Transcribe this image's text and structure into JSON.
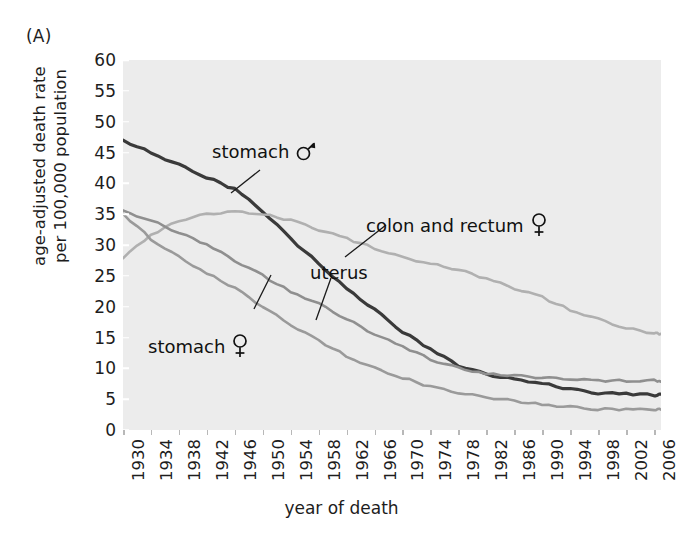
{
  "panel": {
    "label": "(A)"
  },
  "axes": {
    "ylabel": "age-adjusted death rate\nper 100,000 population",
    "ylabel_line1": "age-adjusted death rate",
    "ylabel_line2": "per 100,000 population",
    "xlabel": "year of death"
  },
  "annotations": [
    {
      "name": "stomach-male",
      "text": "stomach",
      "symbol": "male-symbol"
    },
    {
      "name": "colon-and-rectum-female",
      "text": "colon and rectum",
      "symbol": "female-symbol"
    },
    {
      "name": "uterus",
      "text": "uterus",
      "symbol": "none"
    },
    {
      "name": "stomach-female",
      "text": "stomach",
      "symbol": "female-symbol"
    }
  ],
  "colors": {
    "plot_background": "#ececec",
    "stomach_male": "#3a3a3a",
    "colon_rectum_female": "#b0b0b0",
    "uterus": "#8f8f8f",
    "stomach_female": "#9a9a9a",
    "text": "#1d1d1d"
  },
  "chart_data": {
    "type": "line",
    "title": "",
    "xlabel": "year of death",
    "ylabel": "age-adjusted death rate per 100,000 population",
    "xlim": [
      1930,
      2007
    ],
    "ylim": [
      0,
      60
    ],
    "ytick_labels": [
      0,
      5,
      10,
      15,
      20,
      25,
      30,
      35,
      40,
      45,
      50,
      55,
      60
    ],
    "xtick_labels": [
      1930,
      1934,
      1938,
      1942,
      1946,
      1950,
      1954,
      1958,
      1962,
      1966,
      1970,
      1974,
      1978,
      1982,
      1986,
      1990,
      1994,
      1998,
      2002,
      2006
    ],
    "grid": false,
    "legend_position": "inline-annotations",
    "x": [
      1930,
      1934,
      1938,
      1942,
      1946,
      1950,
      1954,
      1958,
      1962,
      1966,
      1970,
      1974,
      1978,
      1982,
      1986,
      1990,
      1994,
      1998,
      2002,
      2006,
      2007
    ],
    "series": [
      {
        "name": "stomach",
        "label": "stomach ♂",
        "sex": "male",
        "color": "#3a3a3a",
        "values": [
          47.0,
          45.0,
          43.0,
          41.0,
          39.0,
          35.5,
          31.0,
          27.0,
          23.0,
          19.5,
          16.0,
          13.0,
          10.5,
          9.0,
          8.3,
          7.6,
          6.6,
          6.0,
          5.8,
          5.7,
          5.7
        ]
      },
      {
        "name": "colon and rectum",
        "label": "colon and rectum ♀",
        "sex": "female",
        "color": "#b0b0b0",
        "values": [
          28.0,
          31.5,
          34.0,
          35.0,
          35.5,
          35.0,
          34.0,
          32.5,
          31.0,
          29.5,
          28.0,
          27.0,
          26.0,
          24.5,
          23.0,
          21.5,
          19.5,
          18.0,
          16.5,
          15.7,
          15.5
        ]
      },
      {
        "name": "uterus",
        "label": "uterus",
        "sex": "female",
        "color": "#8f8f8f",
        "values": [
          35.5,
          34.0,
          32.0,
          30.0,
          27.5,
          25.0,
          22.5,
          20.5,
          18.0,
          15.5,
          13.5,
          11.5,
          10.0,
          9.2,
          8.8,
          8.5,
          8.2,
          8.0,
          8.0,
          8.0,
          8.0
        ]
      },
      {
        "name": "stomach",
        "label": "stomach ♀",
        "sex": "female",
        "color": "#9a9a9a",
        "values": [
          35.0,
          31.0,
          28.0,
          25.5,
          23.0,
          20.0,
          17.0,
          14.5,
          12.0,
          10.0,
          8.5,
          7.0,
          6.0,
          5.3,
          4.7,
          4.2,
          3.7,
          3.4,
          3.3,
          3.3,
          3.3
        ]
      }
    ]
  }
}
